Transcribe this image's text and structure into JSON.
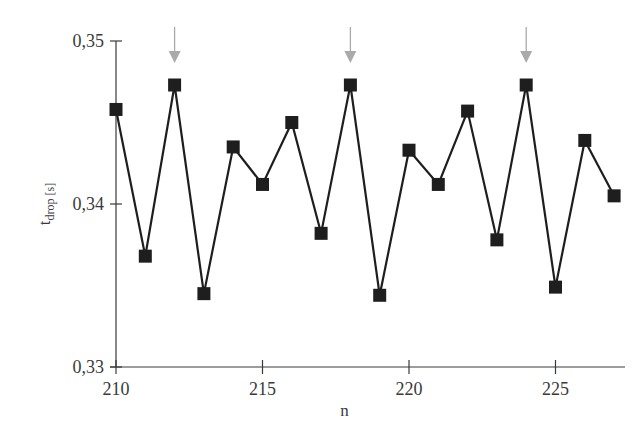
{
  "chart_data": {
    "type": "line",
    "title": "",
    "xlabel": "n",
    "ylabel": "t_drop [s]",
    "ylabel_main": "t",
    "ylabel_sub": "drop [s]",
    "xlim": [
      210,
      227.5
    ],
    "ylim": [
      0.33,
      0.35
    ],
    "x_ticks": [
      210,
      215,
      220,
      225
    ],
    "x_tick_labels": [
      "210",
      "215",
      "220",
      "225"
    ],
    "y_ticks": [
      0.33,
      0.34,
      0.35
    ],
    "y_tick_labels": [
      "0,33",
      "0,34",
      "0,35"
    ],
    "grid": false,
    "legend": null,
    "marker": "square",
    "series": [
      {
        "name": "t_drop",
        "color": "#1e1e1e",
        "x": [
          210,
          211,
          212,
          213,
          214,
          215,
          216,
          217,
          218,
          219,
          220,
          221,
          222,
          223,
          224,
          225,
          226,
          227
        ],
        "values": [
          0.3458,
          0.3368,
          0.3473,
          0.3345,
          0.3435,
          0.3412,
          0.345,
          0.3382,
          0.3473,
          0.3344,
          0.3433,
          0.3412,
          0.3457,
          0.3378,
          0.3473,
          0.3349,
          0.3439,
          0.3405
        ]
      }
    ],
    "annotations": [
      {
        "type": "arrow-down",
        "x": 212,
        "color": "#aaaaaa"
      },
      {
        "type": "arrow-down",
        "x": 218,
        "color": "#aaaaaa"
      },
      {
        "type": "arrow-down",
        "x": 224,
        "color": "#aaaaaa"
      }
    ]
  }
}
